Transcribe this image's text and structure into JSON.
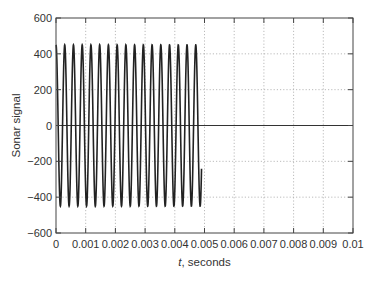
{
  "chart_data": {
    "type": "line",
    "title": "",
    "xlabel_italic": "t",
    "xlabel_rest": ", seconds",
    "xlabel": "t, seconds",
    "ylabel": "Sonar signal",
    "xlim": [
      0,
      0.01
    ],
    "ylim": [
      -600,
      600
    ],
    "x_ticks": [
      0,
      0.001,
      0.002,
      0.003,
      0.004,
      0.005,
      0.006,
      0.007,
      0.008,
      0.009,
      0.01
    ],
    "x_tick_labels": [
      "0",
      "0.001",
      "0.002",
      "0.003",
      "0.004",
      "0.005",
      "0.006",
      "0.007",
      "0.008",
      "0.009",
      "0.01"
    ],
    "y_ticks": [
      600,
      400,
      200,
      0,
      -200,
      -400,
      -600
    ],
    "y_tick_labels": [
      "600",
      "400",
      "200",
      "0",
      "−200",
      "−400",
      "−600"
    ],
    "grid": true,
    "grid_style": "dotted",
    "zero_line": true,
    "series": [
      {
        "name": "sonar pulse",
        "function": "A*cos(2*pi*f*t)",
        "amplitude": 450,
        "frequency_hz": 3400,
        "t_start": 0,
        "t_end": 0.0049,
        "color": "#222222"
      }
    ]
  }
}
